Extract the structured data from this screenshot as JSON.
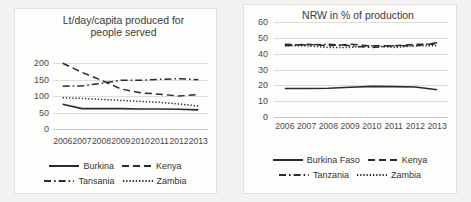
{
  "chart_data": [
    {
      "type": "line",
      "panel": "left",
      "title": "Lt/day/capita produced for people served",
      "xlabel": "",
      "ylabel": "",
      "x": [
        "2006",
        "2007",
        "2008",
        "2009",
        "2010",
        "2011",
        "2012",
        "2013"
      ],
      "ylim": [
        0,
        225
      ],
      "yticks": [
        "0",
        "50",
        "100",
        "150",
        "200"
      ],
      "ytick_values": [
        0,
        50,
        100,
        150,
        200
      ],
      "grid": true,
      "legend_position": "bottom",
      "series": [
        {
          "name": "Burkina",
          "style": "solid",
          "values": [
            75,
            62,
            62,
            62,
            61,
            61,
            60,
            58
          ]
        },
        {
          "name": "Kenya",
          "style": "dashed",
          "values": [
            200,
            172,
            148,
            122,
            110,
            106,
            100,
            105
          ]
        },
        {
          "name": "Tansania",
          "style": "dash-dot",
          "values": [
            130,
            131,
            139,
            148,
            148,
            151,
            153,
            150
          ]
        },
        {
          "name": "Zambia",
          "style": "dotted",
          "values": [
            95,
            93,
            90,
            87,
            84,
            81,
            76,
            70
          ]
        }
      ]
    },
    {
      "type": "line",
      "panel": "right",
      "title": "NRW in % of production",
      "xlabel": "",
      "ylabel": "",
      "x": [
        "2006",
        "2007",
        "2008",
        "2009",
        "2010",
        "2011",
        "2012",
        "2013"
      ],
      "ylim": [
        0,
        62
      ],
      "yticks": [
        "0",
        "10",
        "20",
        "30",
        "40",
        "50",
        "60"
      ],
      "ytick_values": [
        0,
        10,
        20,
        30,
        40,
        50,
        60
      ],
      "grid": true,
      "legend_position": "bottom",
      "series": [
        {
          "name": "Burkina Faso",
          "style": "solid",
          "values": [
            18,
            18,
            18.2,
            18.8,
            19.4,
            19.2,
            19,
            17.2
          ]
        },
        {
          "name": "Kenya",
          "style": "dashed",
          "values": [
            45,
            46,
            45,
            46,
            45,
            45,
            46,
            46
          ]
        },
        {
          "name": "Tanzania",
          "style": "dash-dot",
          "values": [
            46,
            45.5,
            46,
            45,
            44,
            45,
            45,
            47
          ]
        },
        {
          "name": "Zambia",
          "style": "dotted",
          "values": [
            45,
            45,
            44,
            44,
            45,
            44,
            45,
            45
          ]
        }
      ]
    }
  ],
  "colors": {
    "line": "#2b2b2b",
    "grid": "#dedcd9",
    "text": "#3b3b3b",
    "panel_background": "#fdfdfc",
    "page_background": "#f3f2f0"
  }
}
